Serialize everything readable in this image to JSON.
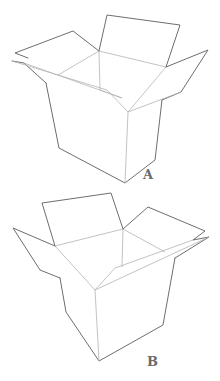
{
  "figure": {
    "stroke_color": "#6e6e6e",
    "inner_stroke_color": "#b4b4b4",
    "background": "#ffffff"
  },
  "boxes": [
    {
      "id": "A",
      "label": "A"
    },
    {
      "id": "B",
      "label": "B"
    }
  ]
}
